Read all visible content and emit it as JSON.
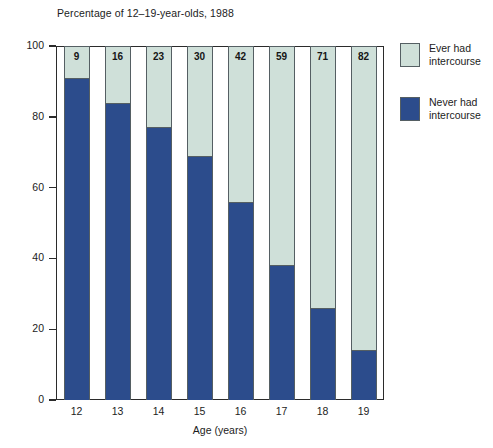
{
  "chart_data": {
    "type": "bar",
    "subtype": "stacked-vertical-100",
    "title": "Percentage of 12–19-year-olds, 1988",
    "xlabel": "Age (years)",
    "ylabel": "",
    "categories": [
      "12",
      "13",
      "14",
      "15",
      "16",
      "17",
      "18",
      "19"
    ],
    "ylim": [
      0,
      100
    ],
    "yticks": [
      "0",
      "20",
      "40",
      "60",
      "80",
      "100"
    ],
    "grid": false,
    "legend_position": "right",
    "series": [
      {
        "name": "Ever had\nintercourse",
        "color": "#cfe0d9",
        "values": [
          9,
          16,
          23,
          30,
          42,
          59,
          71,
          82
        ],
        "labelled": true
      },
      {
        "name": "Never had\nintercourse",
        "color": "#2c4c8c",
        "values": [
          91,
          84,
          77,
          70,
          58,
          41,
          29,
          18
        ],
        "labelled": false
      }
    ],
    "data_labels": [
      "9",
      "16",
      "23",
      "30",
      "42",
      "59",
      "71",
      "82"
    ],
    "bar_top_fraction_of_plot": [
      0.09,
      0.16,
      0.23,
      0.31,
      0.44,
      0.62,
      0.74,
      0.86
    ]
  },
  "legend": {
    "items": [
      {
        "label": "Ever had\nintercourse",
        "color": "#cfe0d9"
      },
      {
        "label": "Never had\nintercourse",
        "color": "#2c4c8c"
      }
    ]
  },
  "colors": {
    "ever_had": "#cfe0d9",
    "never_had": "#2c4c8c",
    "frame": "#2b2b2b",
    "bar_outline": "#555f63",
    "text": "#1c1c1c",
    "background": "#ffffff"
  }
}
